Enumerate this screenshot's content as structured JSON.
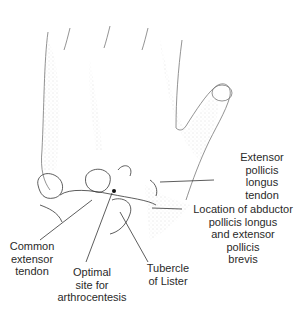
{
  "figure": {
    "labels": {
      "epl": [
        "Extensor",
        "pollicis",
        "longus",
        "tendon"
      ],
      "apl": [
        "Location of abductor",
        "pollicis longus",
        "and extensor",
        "pollicis",
        "brevis"
      ],
      "common": [
        "Common",
        "extensor",
        "tendon"
      ],
      "optimal": [
        "Optimal",
        "site for",
        "arthrocentesis"
      ],
      "lister": [
        "Tubercle",
        "of Lister"
      ]
    },
    "colors": {
      "ink": "#2a2a2a",
      "shade": "#9a9a9a",
      "background": "#ffffff"
    }
  }
}
